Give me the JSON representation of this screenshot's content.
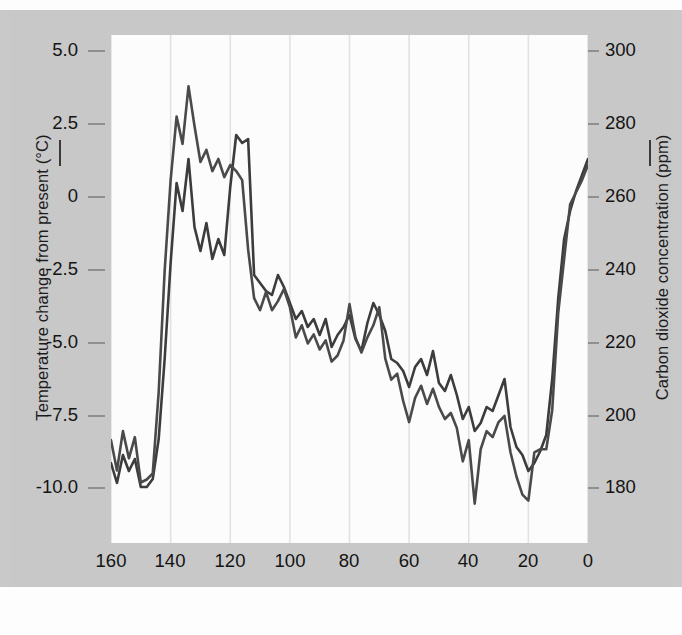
{
  "figure": {
    "background_color": "#c8c8c8",
    "plot_background_color": "#fcfcfc",
    "line_color": "#4a4a4a"
  },
  "axes": {
    "left_title": "Temperature change from present (°C)",
    "right_title": "Carbon dioxide concentration (ppm)",
    "x_title": "Thousands of years ago",
    "left_ticks": [
      "5.0",
      "2.5",
      "0",
      "-2.5",
      "-5.0",
      "-7.5",
      "-10.0"
    ],
    "right_ticks": [
      "300",
      "280",
      "260",
      "240",
      "220",
      "200",
      "180"
    ],
    "x_ticks": [
      "160",
      "140",
      "120",
      "100",
      "80",
      "60",
      "40",
      "20",
      "0"
    ]
  },
  "legend": {
    "temperature_marker": "line-dash",
    "co2_marker": "line-dash"
  },
  "chart_data": {
    "type": "line",
    "title": "",
    "xlabel": "Thousands of years ago",
    "ylabel": "Temperature change from present (°C)",
    "y2label": "Carbon dioxide concentration (ppm)",
    "xlim": [
      160,
      0
    ],
    "x_reversed": true,
    "ylim": [
      -11.0,
      5.8
    ],
    "y2lim": [
      176.0,
      303.0
    ],
    "ytick_values": [
      5.0,
      2.5,
      0,
      -2.5,
      -5.0,
      -7.5,
      -10.0
    ],
    "y2tick_values": [
      300,
      280,
      260,
      240,
      220,
      200,
      180
    ],
    "xtick_values": [
      160,
      140,
      120,
      100,
      80,
      60,
      40,
      20,
      0
    ],
    "grid": "vertical",
    "legend_position": "axis-labels",
    "series": [
      {
        "name": "Temperature change from present (°C)",
        "axis": "left",
        "units": "°C",
        "x": [
          160,
          158,
          156,
          154,
          152,
          150,
          148,
          146,
          144,
          142,
          140,
          138,
          136,
          134,
          132,
          130,
          128,
          126,
          124,
          122,
          120,
          118,
          116,
          114,
          112,
          110,
          108,
          106,
          104,
          102,
          100,
          98,
          96,
          94,
          92,
          90,
          88,
          86,
          84,
          82,
          80,
          78,
          76,
          74,
          72,
          70,
          68,
          66,
          64,
          62,
          60,
          58,
          56,
          54,
          52,
          50,
          48,
          46,
          44,
          42,
          40,
          38,
          36,
          34,
          32,
          30,
          28,
          26,
          24,
          22,
          20,
          18,
          16,
          14,
          12,
          10,
          8,
          6,
          4,
          2,
          0
        ],
        "values": [
          -7.6,
          -8.6,
          -7.3,
          -8.2,
          -7.5,
          -9.0,
          -8.9,
          -8.7,
          -6.0,
          -2.0,
          1.0,
          3.1,
          2.2,
          4.1,
          2.8,
          1.6,
          2.0,
          1.3,
          1.7,
          1.1,
          1.5,
          1.3,
          1.0,
          -1.3,
          -2.9,
          -3.3,
          -2.7,
          -3.3,
          -3.0,
          -2.6,
          -3.2,
          -4.2,
          -3.8,
          -4.4,
          -4.1,
          -4.6,
          -4.3,
          -5.0,
          -4.8,
          -4.3,
          -3.1,
          -4.2,
          -4.7,
          -4.2,
          -3.8,
          -3.2,
          -4.9,
          -5.6,
          -5.4,
          -6.3,
          -7.0,
          -6.2,
          -5.8,
          -6.4,
          -5.9,
          -6.5,
          -6.9,
          -6.7,
          -7.2,
          -8.3,
          -7.6,
          -9.7,
          -7.9,
          -7.3,
          -7.5,
          -7.0,
          -6.8,
          -8.0,
          -8.8,
          -9.4,
          -9.6,
          -8.0,
          -7.9,
          -7.9,
          -6.6,
          -3.4,
          -1.6,
          0.2,
          0.6,
          1.0,
          1.5
        ]
      },
      {
        "name": "Carbon dioxide concentration (ppm)",
        "axis": "right",
        "units": "ppm",
        "x": [
          160,
          158,
          156,
          154,
          152,
          150,
          148,
          146,
          144,
          142,
          140,
          138,
          136,
          134,
          132,
          130,
          128,
          126,
          124,
          122,
          120,
          118,
          116,
          114,
          112,
          110,
          108,
          106,
          104,
          102,
          100,
          98,
          96,
          94,
          92,
          90,
          88,
          86,
          84,
          82,
          80,
          78,
          76,
          74,
          72,
          70,
          68,
          66,
          64,
          62,
          60,
          58,
          56,
          54,
          52,
          50,
          48,
          46,
          44,
          42,
          40,
          38,
          36,
          34,
          32,
          30,
          28,
          26,
          24,
          22,
          20,
          18,
          16,
          14,
          12,
          10,
          8,
          6,
          4,
          2,
          0
        ],
        "values": [
          196,
          191,
          198,
          194,
          197,
          190,
          190,
          192,
          202,
          222,
          246,
          266,
          259,
          272,
          255,
          249,
          256,
          247,
          252,
          248,
          265,
          278,
          276,
          277,
          243,
          241,
          239,
          238,
          243,
          240,
          236,
          232,
          234,
          230,
          232,
          228,
          232,
          225,
          228,
          230,
          233,
          227,
          224,
          231,
          236,
          233,
          229,
          222,
          221,
          219,
          215,
          220,
          222,
          218,
          224,
          216,
          214,
          218,
          213,
          207,
          210,
          204,
          206,
          210,
          209,
          213,
          217,
          205,
          200,
          198,
          194,
          196,
          199,
          203,
          217,
          237,
          252,
          259,
          264,
          268,
          272
        ]
      }
    ]
  }
}
